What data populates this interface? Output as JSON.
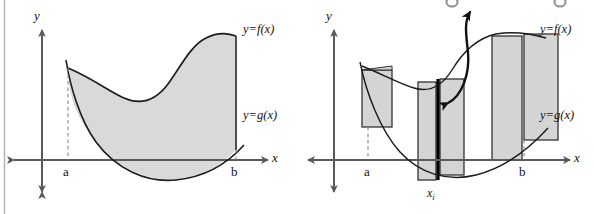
{
  "figure": {
    "title_fragment_visible": "",
    "left_panel": {
      "name": "area-between-curves",
      "axis_y_label": "y",
      "axis_x_label": "x",
      "lower_limit_label": "a",
      "upper_limit_label": "b",
      "upper_curve_label": "y=f(x)",
      "lower_curve_label": "y=g(x)"
    },
    "right_panel": {
      "name": "riemann-sum-approximation",
      "axis_y_label": "y",
      "axis_x_label": "x",
      "lower_limit_label": "a",
      "upper_limit_label": "b",
      "upper_curve_label": "y=f(x)",
      "lower_curve_label": "y=g(x)",
      "sample_point_label": "x",
      "sample_point_subscript": "i",
      "rectangle_count": 5,
      "highlighted_rectangle_index": 2
    },
    "colors": {
      "region_fill": "#d9d9d9",
      "rectangle_fill": "#d4d4d4",
      "curve_stroke": "#1a1a1a",
      "axis_stroke": "#5a5a5a",
      "highlight_stroke": "#000000",
      "dashed_stroke": "#888888",
      "background": "#ffffff",
      "rule_stroke": "#b0b0b0"
    }
  }
}
